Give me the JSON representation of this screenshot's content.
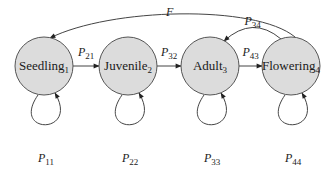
{
  "diagram": {
    "type": "state-transition",
    "nodes": [
      {
        "id": "1",
        "name": "Seedling",
        "index": "1"
      },
      {
        "id": "2",
        "name": "Juvenile",
        "index": "2"
      },
      {
        "id": "3",
        "name": "Adult",
        "index": "3"
      },
      {
        "id": "4",
        "name": "Flowering",
        "index": "4"
      }
    ],
    "edges": [
      {
        "from": "1",
        "to": "2",
        "label": "P",
        "sub": "21",
        "kind": "forward"
      },
      {
        "from": "2",
        "to": "3",
        "label": "P",
        "sub": "32",
        "kind": "forward"
      },
      {
        "from": "3",
        "to": "4",
        "label": "P",
        "sub": "43",
        "kind": "forward"
      },
      {
        "from": "4",
        "to": "3",
        "label": "P",
        "sub": "34",
        "kind": "back"
      },
      {
        "from": "4",
        "to": "1",
        "label": "F",
        "sub": "",
        "kind": "fecundity"
      },
      {
        "from": "1",
        "to": "1",
        "label": "P",
        "sub": "11",
        "kind": "self"
      },
      {
        "from": "2",
        "to": "2",
        "label": "P",
        "sub": "22",
        "kind": "self"
      },
      {
        "from": "3",
        "to": "3",
        "label": "P",
        "sub": "33",
        "kind": "self"
      },
      {
        "from": "4",
        "to": "4",
        "label": "P",
        "sub": "44",
        "kind": "self"
      }
    ],
    "colors": {
      "node_fill": "#dcdcdc",
      "stroke": "#444444"
    }
  }
}
